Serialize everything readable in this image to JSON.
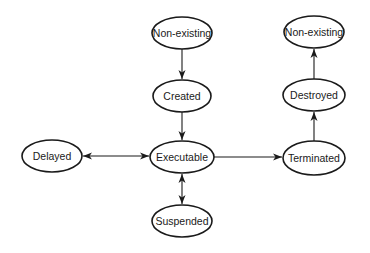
{
  "diagram": {
    "type": "state-transition",
    "nodes": [
      {
        "id": "nonexisting_start",
        "label": "Non-existing",
        "cx": 182,
        "cy": 33,
        "rx": 30,
        "ry": 16
      },
      {
        "id": "created",
        "label": "Created",
        "cx": 182,
        "cy": 96,
        "rx": 29,
        "ry": 16
      },
      {
        "id": "executable",
        "label": "Executable",
        "cx": 182,
        "cy": 157,
        "rx": 32,
        "ry": 16
      },
      {
        "id": "delayed",
        "label": "Delayed",
        "cx": 52,
        "cy": 156,
        "rx": 30,
        "ry": 16
      },
      {
        "id": "suspended",
        "label": "Suspended",
        "cx": 182,
        "cy": 221,
        "rx": 30,
        "ry": 16
      },
      {
        "id": "terminated",
        "label": "Terminated",
        "cx": 314,
        "cy": 158,
        "rx": 31,
        "ry": 17
      },
      {
        "id": "destroyed",
        "label": "Destroyed",
        "cx": 314,
        "cy": 95,
        "rx": 31,
        "ry": 16
      },
      {
        "id": "nonexisting_end",
        "label": "Non-existing",
        "cx": 314,
        "cy": 32,
        "rx": 30,
        "ry": 16
      }
    ],
    "edges": [
      {
        "from": "nonexisting_start",
        "to": "created",
        "direction": "forward"
      },
      {
        "from": "created",
        "to": "executable",
        "direction": "forward"
      },
      {
        "from": "executable",
        "to": "delayed",
        "direction": "both"
      },
      {
        "from": "executable",
        "to": "suspended",
        "direction": "both"
      },
      {
        "from": "executable",
        "to": "terminated",
        "direction": "forward"
      },
      {
        "from": "terminated",
        "to": "destroyed",
        "direction": "forward"
      },
      {
        "from": "destroyed",
        "to": "nonexisting_end",
        "direction": "forward"
      }
    ]
  }
}
